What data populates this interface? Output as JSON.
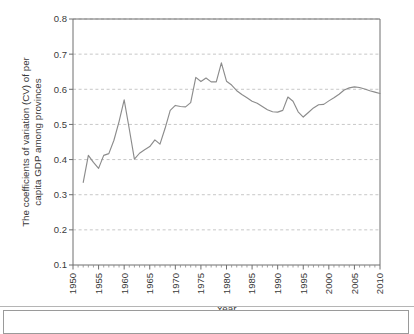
{
  "figure": {
    "axis_title_x": "Year",
    "axis_title_y_line1": "The coefficients of variation (CV) of per",
    "axis_title_y_line2": "capita GDP among provinces",
    "line_color": "#8c8c8c",
    "grid_color": "#b9b9b9",
    "axis_color": "#6e6e6e"
  },
  "chart_data": {
    "type": "line",
    "title": "",
    "xlabel": "Year",
    "ylabel": "The coefficients of variation (CV) of per capita GDP among provinces",
    "xlim": [
      1950,
      2010
    ],
    "ylim": [
      0.1,
      0.8
    ],
    "grid": true,
    "grid_axis": "y",
    "legend": "none",
    "xticks": [
      1950,
      1955,
      1960,
      1965,
      1970,
      1975,
      1980,
      1985,
      1990,
      1995,
      2000,
      2005,
      2010
    ],
    "xtick_labels": [
      "1950",
      "1955",
      "1960",
      "1965",
      "1970",
      "1975",
      "1980",
      "1985",
      "1990",
      "1995",
      "2000",
      "2005",
      "2010"
    ],
    "xtick_rotation": 90,
    "xminor_tick_interval": 1,
    "yticks": [
      0.1,
      0.2,
      0.3,
      0.4,
      0.5,
      0.6,
      0.7,
      0.8
    ],
    "ytick_labels": [
      "0.1",
      "0.2",
      "0.3",
      "0.4",
      "0.5",
      "0.6",
      "0.7",
      "0.8"
    ],
    "x": [
      1952,
      1953,
      1954,
      1955,
      1956,
      1957,
      1958,
      1959,
      1960,
      1961,
      1962,
      1963,
      1964,
      1965,
      1966,
      1967,
      1968,
      1969,
      1970,
      1971,
      1972,
      1973,
      1974,
      1975,
      1976,
      1977,
      1978,
      1979,
      1980,
      1981,
      1982,
      1983,
      1984,
      1985,
      1986,
      1987,
      1988,
      1989,
      1990,
      1991,
      1992,
      1993,
      1994,
      1995,
      1996,
      1997,
      1998,
      1999,
      2000,
      2001,
      2002,
      2003,
      2004,
      2005,
      2006,
      2007,
      2008,
      2009,
      2010
    ],
    "values": [
      0.335,
      0.412,
      0.392,
      0.375,
      0.412,
      0.417,
      0.455,
      0.508,
      0.57,
      0.487,
      0.401,
      0.418,
      0.428,
      0.437,
      0.456,
      0.444,
      0.489,
      0.54,
      0.554,
      0.551,
      0.55,
      0.562,
      0.634,
      0.622,
      0.632,
      0.621,
      0.621,
      0.675,
      0.623,
      0.612,
      0.596,
      0.585,
      0.576,
      0.566,
      0.56,
      0.551,
      0.542,
      0.536,
      0.535,
      0.54,
      0.578,
      0.566,
      0.536,
      0.521,
      0.534,
      0.547,
      0.556,
      0.557,
      0.567,
      0.576,
      0.586,
      0.598,
      0.604,
      0.607,
      0.605,
      0.601,
      0.596,
      0.592,
      0.588
    ],
    "series": [
      {
        "name": "CV of per capita GDP among provinces",
        "values": [
          0.335,
          0.412,
          0.392,
          0.375,
          0.412,
          0.417,
          0.455,
          0.508,
          0.57,
          0.487,
          0.401,
          0.418,
          0.428,
          0.437,
          0.456,
          0.444,
          0.489,
          0.54,
          0.554,
          0.551,
          0.55,
          0.562,
          0.634,
          0.622,
          0.632,
          0.621,
          0.621,
          0.675,
          0.623,
          0.612,
          0.596,
          0.585,
          0.576,
          0.566,
          0.56,
          0.551,
          0.542,
          0.536,
          0.535,
          0.54,
          0.578,
          0.566,
          0.536,
          0.521,
          0.534,
          0.547,
          0.556,
          0.557,
          0.567,
          0.576,
          0.586,
          0.598,
          0.604,
          0.607,
          0.605,
          0.601,
          0.596,
          0.592,
          0.588
        ]
      }
    ]
  }
}
